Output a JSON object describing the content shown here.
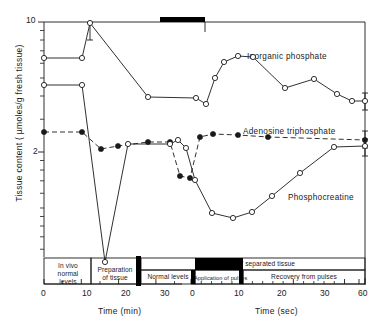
{
  "chart_data": {
    "type": "line",
    "title": "",
    "xlabel_left": "Time (min)",
    "xlabel_right": "Time (sec)",
    "ylabel": "Tissue content ( µmoles/g fresh tissue)",
    "yscale": "log",
    "ylim": [
      0.55,
      11.5
    ],
    "y_major_ticks": [
      {
        "value": 10,
        "label": "10"
      },
      {
        "value": 2,
        "label": "2"
      }
    ],
    "y_minor_ticks": [
      9,
      8,
      7,
      6,
      5,
      4,
      3,
      1.8,
      1.6,
      1.4,
      1.2,
      1.0,
      0.9,
      0.8,
      0.7,
      0.6
    ],
    "x_axis_left": {
      "label": "Time (min)",
      "unit": "min",
      "ticks": [
        0,
        10,
        20,
        30
      ],
      "tick_labels": [
        "0",
        "10",
        "20",
        "30"
      ],
      "minor_ticks": [
        5,
        15,
        25,
        35
      ],
      "range": [
        0,
        37
      ]
    },
    "x_axis_right": {
      "label": "Time (sec)",
      "unit": "sec",
      "ticks": [
        0,
        10,
        20,
        30,
        60
      ],
      "tick_labels": [
        "0",
        "10",
        "20",
        "30",
        "60"
      ],
      "minor_ticks": [
        2,
        4,
        6,
        8,
        12,
        14,
        16,
        18,
        22,
        24,
        26,
        28
      ],
      "range": [
        0,
        60
      ]
    },
    "grid": false,
    "legend_position": "inline-annotations",
    "series": [
      {
        "name": "Inorganic phosphate",
        "marker": "open-circle",
        "line": "solid",
        "label_x_px": 247,
        "label_y_px": 57,
        "points": [
          {
            "px": 44,
            "py": 58,
            "marker": true,
            "errorbar": false
          },
          {
            "px": 82,
            "py": 58,
            "marker": true,
            "errorbar": false
          },
          {
            "px": 90,
            "py": 23,
            "marker": true,
            "errorbar": true,
            "err_lo_py": 40,
            "err_hi_py": 23
          },
          {
            "px": 148,
            "py": 97,
            "marker": true,
            "errorbar": false
          },
          {
            "px": 196,
            "py": 98,
            "marker": true,
            "errorbar": false
          },
          {
            "px": 206,
            "py": 104,
            "marker": true,
            "errorbar": false
          },
          {
            "px": 215,
            "py": 78,
            "marker": true,
            "errorbar": false
          },
          {
            "px": 224,
            "py": 62,
            "marker": true,
            "errorbar": false
          },
          {
            "px": 238,
            "py": 56,
            "marker": true,
            "errorbar": false
          },
          {
            "px": 253,
            "py": 57,
            "marker": true,
            "errorbar": false
          },
          {
            "px": 285,
            "py": 88,
            "marker": true,
            "errorbar": false
          },
          {
            "px": 314,
            "py": 79,
            "marker": true,
            "errorbar": false
          },
          {
            "px": 337,
            "py": 94,
            "marker": true,
            "errorbar": false
          },
          {
            "px": 352,
            "py": 101,
            "marker": true,
            "errorbar": false
          },
          {
            "px": 365,
            "py": 101,
            "marker": true,
            "errorbar": true,
            "err_lo_py": 110,
            "err_hi_py": 93
          }
        ]
      },
      {
        "name": "Adenosine triphosphate",
        "marker": "filled-circle",
        "line": "dashed",
        "label_x_px": 243,
        "label_y_px": 132,
        "points": [
          {
            "px": 44,
            "py": 132,
            "marker": true,
            "errorbar": false
          },
          {
            "px": 82,
            "py": 132,
            "marker": true,
            "errorbar": false
          },
          {
            "px": 101,
            "py": 149,
            "marker": true,
            "errorbar": false
          },
          {
            "px": 118,
            "py": 146,
            "marker": true,
            "errorbar": false
          },
          {
            "px": 148,
            "py": 142,
            "marker": true,
            "errorbar": false
          },
          {
            "px": 170,
            "py": 142,
            "marker": true,
            "errorbar": false
          },
          {
            "px": 180,
            "py": 176,
            "marker": true,
            "errorbar": false
          },
          {
            "px": 190,
            "py": 178,
            "marker": true,
            "errorbar": false
          },
          {
            "px": 200,
            "py": 137,
            "marker": true,
            "errorbar": false
          },
          {
            "px": 213,
            "py": 134,
            "marker": true,
            "errorbar": false
          },
          {
            "px": 238,
            "py": 135,
            "marker": true,
            "errorbar": false
          },
          {
            "px": 268,
            "py": 137,
            "marker": true,
            "errorbar": false
          },
          {
            "px": 365,
            "py": 140,
            "marker": true,
            "errorbar": true,
            "err_lo_py": 148,
            "err_hi_py": 131
          }
        ]
      },
      {
        "name": "Phosphocreatine",
        "marker": "open-circle",
        "line": "solid",
        "label_x_px": 288,
        "label_y_px": 198,
        "points": [
          {
            "px": 44,
            "py": 85,
            "marker": true,
            "errorbar": false
          },
          {
            "px": 82,
            "py": 85,
            "marker": true,
            "errorbar": false
          },
          {
            "px": 105,
            "py": 262,
            "marker": true,
            "errorbar": false
          },
          {
            "px": 128,
            "py": 144,
            "marker": true,
            "errorbar": false
          },
          {
            "px": 170,
            "py": 144,
            "marker": true,
            "errorbar": false
          },
          {
            "px": 178,
            "py": 140,
            "marker": true,
            "errorbar": false
          },
          {
            "px": 186,
            "py": 148,
            "marker": true,
            "errorbar": false
          },
          {
            "px": 195,
            "py": 180,
            "marker": true,
            "errorbar": false
          },
          {
            "px": 212,
            "py": 213,
            "marker": true,
            "errorbar": false
          },
          {
            "px": 233,
            "py": 218,
            "marker": true,
            "errorbar": false
          },
          {
            "px": 252,
            "py": 212,
            "marker": true,
            "errorbar": false
          },
          {
            "px": 272,
            "py": 196,
            "marker": true,
            "errorbar": false
          },
          {
            "px": 300,
            "py": 173,
            "marker": true,
            "errorbar": false
          },
          {
            "px": 334,
            "py": 147,
            "marker": true,
            "errorbar": false
          },
          {
            "px": 365,
            "py": 146,
            "marker": true,
            "errorbar": true,
            "err_lo_py": 156,
            "err_hi_py": 139
          }
        ]
      }
    ],
    "annotations": {
      "pulse_bar": {
        "description": "black bar marking application of pulses",
        "x_start_px": 160,
        "x_end_px": 205,
        "y_px": 22
      },
      "phase_bars_row1": [
        {
          "text": "In vivo\nnormal\nlevels",
          "x_start_px": 44,
          "x_end_px": 91
        },
        {
          "text": "Preparation\nof tissue",
          "x_start_px": 91,
          "x_end_px": 137
        },
        {
          "text": "In slices of separated tissue",
          "x_start_px": 141,
          "x_end_px": 365
        }
      ],
      "phase_bars_row2": [
        {
          "text": "Normal levels",
          "x_start_px": 141,
          "x_end_px": 195
        },
        {
          "text": "Application of pulses",
          "x_start_px": 195,
          "x_end_px": 243
        },
        {
          "text": "Recovery from pulses",
          "x_start_px": 243,
          "x_end_px": 365
        }
      ]
    }
  },
  "axis": {
    "ylabel": "Tissue content ( µmoles/g fresh tissue)",
    "y_tick_10": "10",
    "y_tick_2": "2",
    "xlabel_min": "Time (min)",
    "xlabel_sec": "Time (sec)",
    "x_min_0": "0",
    "x_min_10": "10",
    "x_min_20": "20",
    "x_min_30": "30",
    "x_sec_0": "0",
    "x_sec_10": "10",
    "x_sec_20": "20",
    "x_sec_30": "30",
    "x_sec_60": "60"
  },
  "series_labels": {
    "inorganic_phosphate": "Inorganic phosphate",
    "adenosine_triphosphate": "Adenosine triphosphate",
    "phosphocreatine": "Phosphocreatine"
  },
  "phases": {
    "in_vivo_1": "In vivo",
    "in_vivo_2": "normal",
    "in_vivo_3": "levels",
    "prep_1": "Preparation",
    "prep_2": "of tissue",
    "slices": "In slices of separated tissue",
    "normal_levels": "Normal levels",
    "application_of_pulses": "Application of pulses",
    "recovery": "Recovery from pulses"
  },
  "colors": {
    "ink": "#1a1a1a",
    "bar_fill": "#000000",
    "background": "#ffffff"
  }
}
